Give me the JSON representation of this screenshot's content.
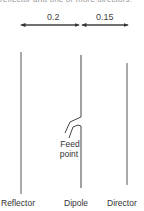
{
  "caption": "reflector and one or more directors.",
  "dimensions": [
    {
      "label": "0.2",
      "from": "Reflector",
      "to": "Dipole"
    },
    {
      "label": "0.15",
      "from": "Dipole",
      "to": "Director"
    }
  ],
  "elements": {
    "reflector": "Reflector",
    "dipole": "Dipole",
    "director": "Director"
  },
  "feed_point": {
    "line1": "Feed",
    "line2": "point"
  },
  "colors": {
    "line": "#444444",
    "text": "#333333"
  }
}
